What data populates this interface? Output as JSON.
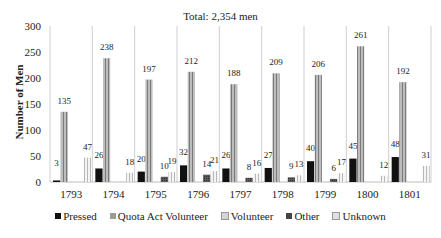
{
  "chart_data": {
    "type": "bar",
    "title": "Total: 2,354 men",
    "xlabel": "",
    "ylabel": "Number of Men",
    "ylim": [
      0,
      300
    ],
    "yticks": [
      0,
      50,
      100,
      150,
      200,
      250,
      300
    ],
    "grid": "vertical separators between categories",
    "legend_position": "bottom",
    "categories": [
      "1793",
      "1794",
      "1795",
      "1796",
      "1797",
      "1798",
      "1799",
      "1800",
      "1801"
    ],
    "series": [
      {
        "name": "Pressed",
        "color": "#111111",
        "values": [
          3,
          26,
          20,
          32,
          26,
          27,
          40,
          45,
          48
        ]
      },
      {
        "name": "Quota Act Volunteer",
        "color": "#9a9a9a",
        "values": [
          135,
          238,
          197,
          212,
          188,
          209,
          206,
          261,
          192
        ]
      },
      {
        "name": "Volunteer",
        "color": "#d8d8d8",
        "values": [
          0,
          0,
          0,
          0,
          0,
          0,
          0,
          0,
          0
        ]
      },
      {
        "name": "Other",
        "color": "#444444",
        "values": [
          0,
          0,
          10,
          14,
          8,
          9,
          6,
          0,
          0
        ]
      },
      {
        "name": "Unknown",
        "color": "#e6e6e6",
        "values": [
          47,
          18,
          19,
          21,
          16,
          13,
          17,
          12,
          31
        ]
      }
    ],
    "labeled_series": [
      "Pressed",
      "Quota Act Volunteer",
      "Other",
      "Unknown"
    ]
  },
  "labels": {
    "title": "Total: 2,354 men",
    "ylabel": "Number of Men",
    "legend": [
      "Pressed",
      "Quota Act Volunteer",
      "Volunteer",
      "Other",
      "Unknown"
    ]
  }
}
